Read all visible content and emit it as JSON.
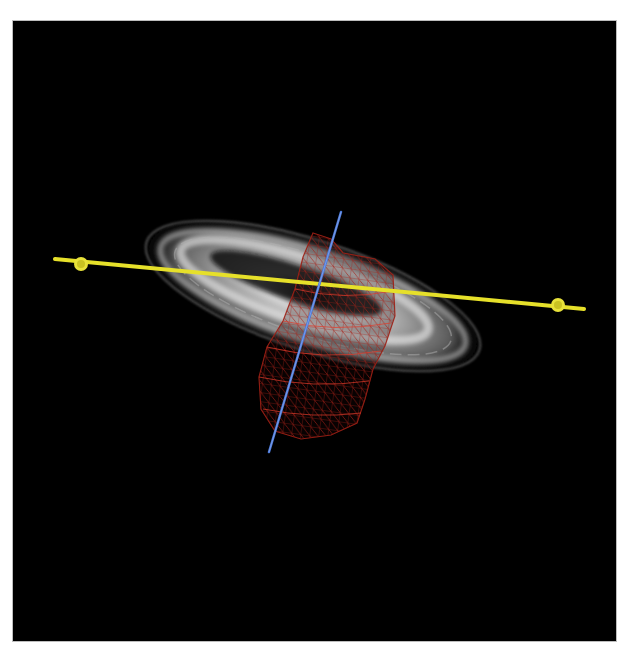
{
  "canvas": {
    "width": 623,
    "height": 650,
    "page_background": "#ffffff"
  },
  "viewport": {
    "x": 12,
    "y": 20,
    "width": 605,
    "height": 622,
    "background": "#000000",
    "border": "#bdbdbd"
  },
  "volume_render": {
    "label": "ultrasound-volume",
    "center": [
      300,
      275
    ],
    "rx": 180,
    "ry": 58,
    "rotation_deg": 18,
    "color": "#e8e8e8"
  },
  "mesh": {
    "label": "red-wireframe-mesh",
    "color": "#d42a1e",
    "outline": [
      [
        300,
        212
      ],
      [
        318,
        218
      ],
      [
        330,
        232
      ],
      [
        362,
        238
      ],
      [
        380,
        254
      ],
      [
        382,
        295
      ],
      [
        372,
        325
      ],
      [
        360,
        348
      ],
      [
        352,
        378
      ],
      [
        344,
        402
      ],
      [
        318,
        414
      ],
      [
        288,
        418
      ],
      [
        262,
        410
      ],
      [
        248,
        388
      ],
      [
        246,
        356
      ],
      [
        254,
        326
      ],
      [
        270,
        300
      ],
      [
        282,
        268
      ],
      [
        290,
        236
      ]
    ]
  },
  "axes": [
    {
      "label": "yellow-axis",
      "color": "#e6e02a",
      "from": [
        42,
        238
      ],
      "to": [
        571,
        288
      ],
      "width": 4,
      "handles": [
        {
          "at": [
            68,
            243
          ]
        },
        {
          "at": [
            545,
            284
          ]
        }
      ]
    },
    {
      "label": "blue-axis",
      "color": "#4a78d8",
      "from": [
        328,
        191
      ],
      "to": [
        256,
        431
      ],
      "width": 2.5,
      "handles": []
    }
  ]
}
